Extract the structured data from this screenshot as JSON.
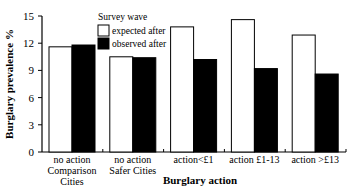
{
  "chart_data": {
    "type": "bar",
    "title": "",
    "xlabel": "Burglary action",
    "ylabel": "Burglary prevalence %",
    "ylim": [
      0,
      15
    ],
    "yticks": [
      0,
      3,
      6,
      9,
      12,
      15
    ],
    "grid": false,
    "legend_title": "Survey wave",
    "legend_position": "top-left inside",
    "categories": [
      [
        "no action",
        "Comparison",
        "Cities"
      ],
      [
        "no action",
        "Safer Cities"
      ],
      [
        "action<£1"
      ],
      [
        "action £1-13"
      ],
      [
        "action >£13"
      ]
    ],
    "series": [
      {
        "name": "expected after",
        "color": "#ffffff",
        "values": [
          11.6,
          10.5,
          13.8,
          14.6,
          12.9
        ]
      },
      {
        "name": "observed after",
        "color": "#000000",
        "values": [
          11.8,
          10.4,
          10.2,
          9.2,
          8.6
        ]
      }
    ]
  }
}
